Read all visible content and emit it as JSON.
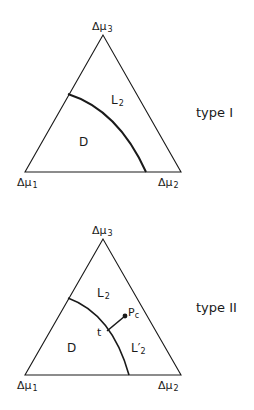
{
  "diagrams": [
    {
      "type_label": "type I",
      "vertices": {
        "top": "Δμ",
        "top_sub": "3",
        "left": "Δμ",
        "left_sub": "1",
        "right": "Δμ",
        "right_sub": "2"
      },
      "regions": [
        {
          "label": "L",
          "sub": "2"
        },
        {
          "label": "D",
          "sub": ""
        }
      ]
    },
    {
      "type_label": "type II",
      "vertices": {
        "top": "Δμ",
        "top_sub": "3",
        "left": "Δμ",
        "left_sub": "1",
        "right": "Δμ",
        "right_sub": "2"
      },
      "regions": [
        {
          "label": "L",
          "sub": "2"
        },
        {
          "label": "D",
          "sub": ""
        },
        {
          "label": "L′",
          "sub": "2"
        }
      ],
      "points": [
        {
          "label": "t",
          "sub": ""
        },
        {
          "label": "P",
          "sub": "c"
        }
      ]
    }
  ],
  "colors": {
    "ink": "#1a1a1a",
    "background": "#ffffff"
  }
}
